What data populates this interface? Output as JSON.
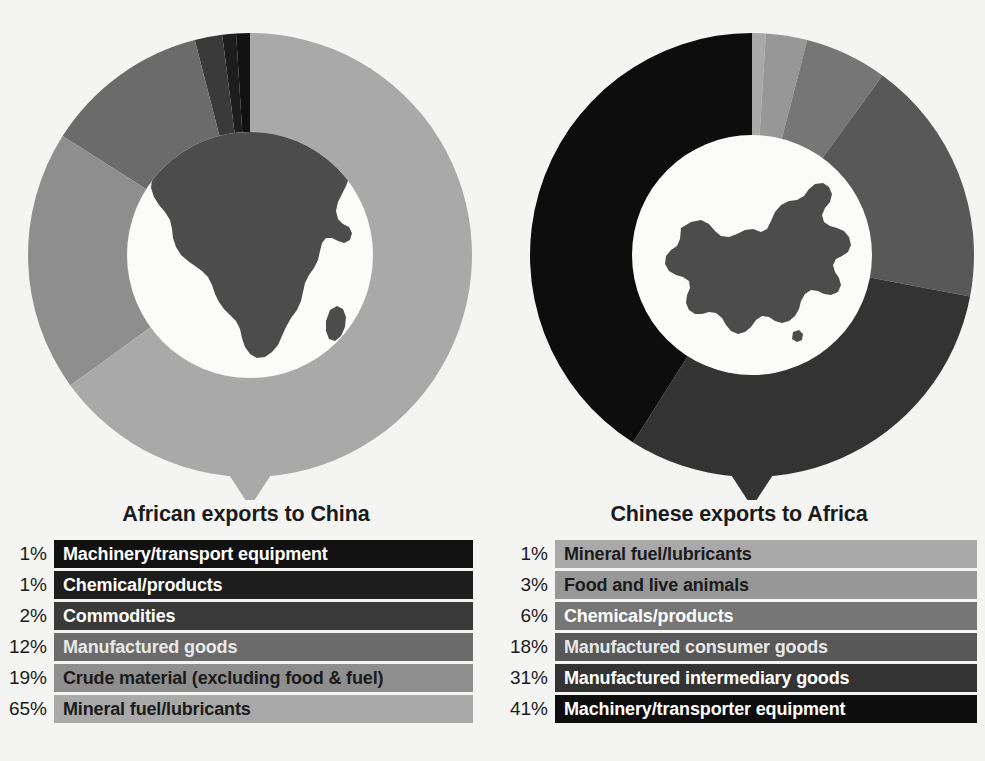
{
  "background_color": "#f4f4f2",
  "panels": [
    {
      "id": "african-exports-to-china",
      "title": "African exports to China",
      "center_icon": "africa-map-icon",
      "chart": {
        "type": "pie",
        "title": "African exports to China",
        "categories": [
          "Machinery/transport equipment",
          "Chemical/products",
          "Commodities",
          "Manufactured goods",
          "Crude material (excluding food & fuel)",
          "Mineral fuel/lubricants"
        ],
        "values": [
          1,
          1,
          2,
          12,
          19,
          65
        ],
        "unit": "%",
        "colors": [
          "#111111",
          "#1d1d1d",
          "#3a3a3a",
          "#6b6b6b",
          "#8e8e8e",
          "#a9a9a9"
        ],
        "label_colors": [
          "#ffffff",
          "#ffffff",
          "#ffffff",
          "#e8e8e8",
          "#1b1b1b",
          "#1b1b1b"
        ],
        "legend_position": "below",
        "direction": "counterclockwise",
        "start_angle_deg": 0
      },
      "legend": [
        {
          "pct": "1%",
          "label": "Machinery/transport equipment"
        },
        {
          "pct": "1%",
          "label": "Chemical/products"
        },
        {
          "pct": "2%",
          "label": "Commodities"
        },
        {
          "pct": "12%",
          "label": "Manufactured goods"
        },
        {
          "pct": "19%",
          "label": "Crude material (excluding food & fuel)"
        },
        {
          "pct": "65%",
          "label": "Mineral fuel/lubricants"
        }
      ]
    },
    {
      "id": "chinese-exports-to-africa",
      "title": "Chinese exports to Africa",
      "center_icon": "china-map-icon",
      "chart": {
        "type": "pie",
        "title": "Chinese exports to Africa",
        "categories": [
          "Mineral fuel/lubricants",
          "Food and live animals",
          "Chemicals/products",
          "Manufactured consumer goods",
          "Manufactured intermediary goods",
          "Machinery/transporter equipment"
        ],
        "values": [
          1,
          3,
          6,
          18,
          31,
          41
        ],
        "unit": "%",
        "colors": [
          "#a9a9a9",
          "#979797",
          "#767676",
          "#585858",
          "#333333",
          "#0d0d0d"
        ],
        "label_colors": [
          "#1b1b1b",
          "#1b1b1b",
          "#ffffff",
          "#e8e8e8",
          "#ffffff",
          "#ffffff"
        ],
        "legend_position": "below",
        "direction": "clockwise",
        "start_angle_deg": 0
      },
      "legend": [
        {
          "pct": "1%",
          "label": "Mineral fuel/lubricants"
        },
        {
          "pct": "3%",
          "label": "Food and live animals"
        },
        {
          "pct": "6%",
          "label": "Chemicals/products"
        },
        {
          "pct": "18%",
          "label": "Manufactured consumer goods"
        },
        {
          "pct": "31%",
          "label": "Manufactured intermediary goods"
        },
        {
          "pct": "41%",
          "label": "Machinery/transporter equipment"
        }
      ]
    }
  ],
  "chart_data": [
    {
      "type": "pie",
      "title": "African exports to China",
      "categories": [
        "Machinery/transport equipment",
        "Chemical/products",
        "Commodities",
        "Manufactured goods",
        "Crude material (excluding food & fuel)",
        "Mineral fuel/lubricants"
      ],
      "values": [
        1,
        1,
        2,
        12,
        19,
        65
      ],
      "unit": "%",
      "xlabel": "",
      "ylabel": "",
      "legend_position": "below",
      "grid": false
    },
    {
      "type": "pie",
      "title": "Chinese exports to Africa",
      "categories": [
        "Mineral fuel/lubricants",
        "Food and live animals",
        "Chemicals/products",
        "Manufactured consumer goods",
        "Manufactured intermediary goods",
        "Machinery/transporter equipment"
      ],
      "values": [
        1,
        3,
        6,
        18,
        31,
        41
      ],
      "unit": "%",
      "xlabel": "",
      "ylabel": "",
      "legend_position": "below",
      "grid": false
    }
  ]
}
